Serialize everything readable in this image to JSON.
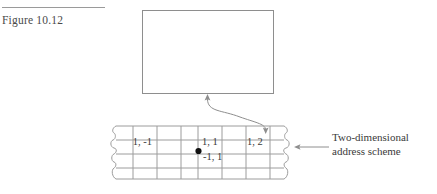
{
  "figure": {
    "label": "Figure 10.12",
    "rule_icon": "horizontal-rule"
  },
  "diagram": {
    "top_box": {
      "name": "empty-rectangle",
      "label": ""
    },
    "connector": {
      "name": "s-curve-double-arrow",
      "from": "grid-cell",
      "to": "rectangle"
    },
    "grid": {
      "name": "two-dimensional-grid",
      "rows": 3,
      "columns": 7,
      "torn_edges": "wavy",
      "marker": {
        "name": "origin-dot",
        "label": ""
      },
      "cells": [
        {
          "label": "1, -1",
          "x": 52,
          "y": 21,
          "align": "right"
        },
        {
          "label": "1, 1",
          "x": 93,
          "y": 21,
          "align": "left"
        },
        {
          "label": "1, 2",
          "x": 137,
          "y": 21,
          "align": "left"
        },
        {
          "label": "-1, 1",
          "x": 93,
          "y": 35,
          "align": "left"
        }
      ]
    },
    "callout": {
      "name": "address-scheme-callout",
      "arrow": "left-arrow",
      "lines": [
        "Two-dimensional",
        "address scheme"
      ]
    }
  },
  "colors": {
    "line": "#8e8e8e",
    "grid_line": "#9c9c9c",
    "text": "#3a3a3a",
    "rule": "#9a9a9a",
    "dot": "#111111"
  }
}
